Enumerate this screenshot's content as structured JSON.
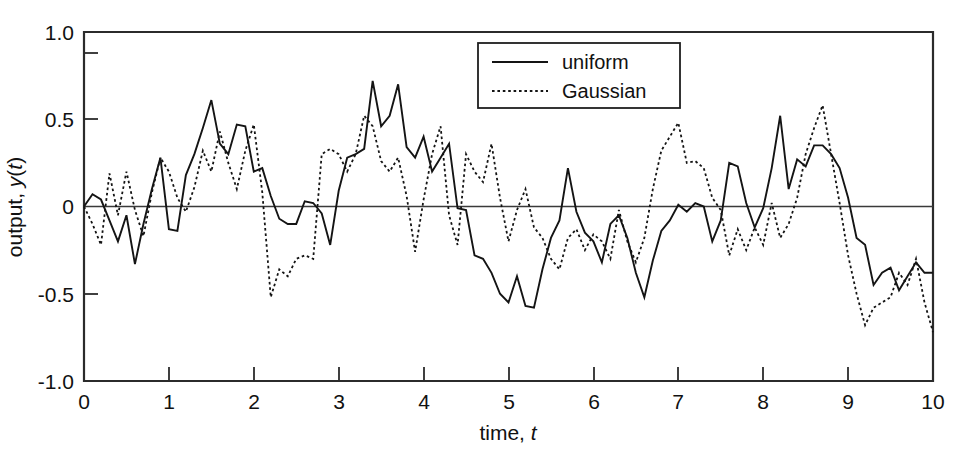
{
  "chart_data": {
    "type": "line",
    "title": "",
    "xlabel": "time, t",
    "ylabel": "output, y(t)",
    "xlim": [
      0,
      10
    ],
    "ylim": [
      -1.0,
      1.0
    ],
    "grid": false,
    "zero_reference_line": true,
    "legend_position": "top-center-right",
    "x_tick_labels": [
      "0",
      "1",
      "2",
      "3",
      "4",
      "5",
      "6",
      "7",
      "8",
      "9",
      "10"
    ],
    "x_ticks": [
      0,
      1,
      2,
      3,
      4,
      5,
      6,
      7,
      8,
      9,
      10
    ],
    "y_tick_labels": [
      "1.0",
      "0.5",
      "0",
      "-0.5",
      "-1.0"
    ],
    "y_ticks": [
      1.0,
      0.5,
      0,
      -0.5,
      -1.0
    ],
    "y_minor_ticks": [
      0.75
    ],
    "sample_interval": 0.1,
    "series": [
      {
        "name": "uniform",
        "style": "solid",
        "color": "#141414",
        "x": [
          0,
          0.1,
          0.2,
          0.3,
          0.4,
          0.5,
          0.6,
          0.7,
          0.8,
          0.9,
          1.0,
          1.1,
          1.2,
          1.3,
          1.4,
          1.5,
          1.6,
          1.7,
          1.8,
          1.9,
          2.0,
          2.1,
          2.2,
          2.3,
          2.4,
          2.5,
          2.6,
          2.7,
          2.8,
          2.9,
          3.0,
          3.1,
          3.2,
          3.3,
          3.4,
          3.5,
          3.6,
          3.7,
          3.8,
          3.9,
          4.0,
          4.1,
          4.2,
          4.3,
          4.4,
          4.5,
          4.6,
          4.7,
          4.8,
          4.9,
          5.0,
          5.1,
          5.2,
          5.3,
          5.4,
          5.5,
          5.6,
          5.7,
          5.8,
          5.9,
          6.0,
          6.1,
          6.2,
          6.3,
          6.4,
          6.5,
          6.6,
          6.7,
          6.8,
          6.9,
          7.0,
          7.1,
          7.2,
          7.3,
          7.4,
          7.5,
          7.6,
          7.7,
          7.8,
          7.9,
          8.0,
          8.1,
          8.2,
          8.3,
          8.4,
          8.5,
          8.6,
          8.7,
          8.8,
          8.9,
          9.0,
          9.1,
          9.2,
          9.3,
          9.4,
          9.5,
          9.6,
          9.7,
          9.8,
          9.9,
          10.0
        ],
        "y": [
          0.0,
          0.07,
          0.04,
          -0.08,
          -0.2,
          -0.05,
          -0.33,
          -0.1,
          0.1,
          0.28,
          -0.13,
          -0.14,
          0.18,
          0.3,
          0.45,
          0.61,
          0.36,
          0.3,
          0.47,
          0.46,
          0.2,
          0.22,
          0.06,
          -0.07,
          -0.1,
          -0.1,
          0.03,
          0.02,
          -0.04,
          -0.22,
          0.09,
          0.28,
          0.3,
          0.33,
          0.72,
          0.46,
          0.52,
          0.7,
          0.34,
          0.28,
          0.4,
          0.2,
          0.28,
          0.36,
          -0.01,
          -0.02,
          -0.28,
          -0.3,
          -0.38,
          -0.5,
          -0.55,
          -0.4,
          -0.57,
          -0.58,
          -0.36,
          -0.18,
          -0.08,
          0.22,
          -0.03,
          -0.15,
          -0.2,
          -0.32,
          -0.1,
          -0.05,
          -0.18,
          -0.38,
          -0.52,
          -0.31,
          -0.14,
          -0.08,
          0.01,
          -0.03,
          0.02,
          0.0,
          -0.2,
          -0.08,
          0.25,
          0.23,
          0.02,
          -0.12,
          -0.01,
          0.22,
          0.52,
          0.1,
          0.27,
          0.23,
          0.35,
          0.35,
          0.3,
          0.22,
          0.05,
          -0.18,
          -0.22,
          -0.45,
          -0.38,
          -0.35,
          -0.48,
          -0.4,
          -0.32,
          -0.38,
          -0.38
        ]
      },
      {
        "name": "Gaussian",
        "style": "dotted",
        "color": "#141414",
        "x": [
          0,
          0.1,
          0.2,
          0.3,
          0.4,
          0.5,
          0.6,
          0.7,
          0.8,
          0.9,
          1.0,
          1.1,
          1.2,
          1.3,
          1.4,
          1.5,
          1.6,
          1.7,
          1.8,
          1.9,
          2.0,
          2.1,
          2.2,
          2.3,
          2.4,
          2.5,
          2.6,
          2.7,
          2.8,
          2.9,
          3.0,
          3.1,
          3.2,
          3.3,
          3.4,
          3.5,
          3.6,
          3.7,
          3.8,
          3.9,
          4.0,
          4.1,
          4.2,
          4.3,
          4.4,
          4.5,
          4.6,
          4.7,
          4.8,
          4.9,
          5.0,
          5.1,
          5.2,
          5.3,
          5.4,
          5.5,
          5.6,
          5.7,
          5.8,
          5.9,
          6.0,
          6.1,
          6.2,
          6.3,
          6.4,
          6.5,
          6.6,
          6.7,
          6.8,
          6.9,
          7.0,
          7.1,
          7.2,
          7.3,
          7.4,
          7.5,
          7.6,
          7.7,
          7.8,
          7.9,
          8.0,
          8.1,
          8.2,
          8.3,
          8.4,
          8.5,
          8.6,
          8.7,
          8.8,
          8.9,
          9.0,
          9.1,
          9.2,
          9.3,
          9.4,
          9.5,
          9.6,
          9.7,
          9.8,
          9.9,
          10.0
        ],
        "y": [
          0.0,
          -0.1,
          -0.22,
          0.19,
          -0.05,
          0.2,
          -0.02,
          -0.17,
          0.08,
          0.28,
          0.2,
          0.05,
          -0.03,
          0.11,
          0.32,
          0.2,
          0.43,
          0.25,
          0.1,
          0.32,
          0.47,
          0.08,
          -0.52,
          -0.36,
          -0.4,
          -0.3,
          -0.28,
          -0.3,
          0.3,
          0.33,
          0.3,
          0.2,
          0.3,
          0.52,
          0.46,
          0.26,
          0.2,
          0.28,
          0.06,
          -0.26,
          0.04,
          0.3,
          0.46,
          -0.05,
          -0.22,
          0.3,
          0.2,
          0.14,
          0.36,
          0.05,
          -0.2,
          -0.02,
          0.1,
          -0.12,
          -0.18,
          -0.3,
          -0.36,
          -0.18,
          -0.13,
          -0.25,
          -0.16,
          -0.2,
          -0.3,
          -0.02,
          -0.2,
          -0.32,
          -0.18,
          0.1,
          0.32,
          0.4,
          0.48,
          0.25,
          0.26,
          0.22,
          0.05,
          -0.02,
          -0.28,
          -0.13,
          -0.25,
          -0.12,
          -0.22,
          0.02,
          -0.18,
          -0.1,
          0.05,
          0.3,
          0.45,
          0.58,
          0.3,
          0.02,
          -0.28,
          -0.5,
          -0.68,
          -0.58,
          -0.55,
          -0.52,
          -0.38,
          -0.45,
          -0.3,
          -0.55,
          -0.72
        ]
      }
    ]
  },
  "legend": {
    "entries": [
      {
        "label": "uniform",
        "style": "solid"
      },
      {
        "label": "Gaussian",
        "style": "dotted"
      }
    ]
  },
  "axes": {
    "x_title_prefix": "time, ",
    "x_title_italic": "t",
    "y_title_prefix": "output, ",
    "y_title_italic": "y",
    "y_title_paren_open": "(",
    "y_title_italic2": "t",
    "y_title_paren_close": ")"
  }
}
